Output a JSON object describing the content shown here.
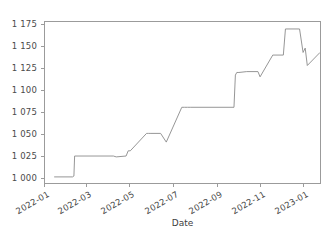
{
  "figure": {
    "title_remnant": "",
    "background_color": "#ffffff",
    "frame_color": "#9b9b9b",
    "line_color": "#8a8a8a"
  },
  "chart_data": {
    "type": "line",
    "title": "",
    "xlabel": "Date",
    "ylabel": "",
    "grid": false,
    "legend": "none",
    "xlim": [
      "2022-01-01",
      "2023-01-26"
    ],
    "ylim": [
      993,
      1178
    ],
    "ytick_labels": [
      "1 175",
      "1 150",
      "1 125",
      "1 100",
      "1 075",
      "1 050",
      "1 025",
      "1 000"
    ],
    "ytick_values": [
      1175,
      1150,
      1125,
      1100,
      1075,
      1050,
      1025,
      1000
    ],
    "xtick_labels": [
      "2022-01",
      "2022-03",
      "2022-05",
      "2022-07",
      "2022-09",
      "2022-11",
      "2023-01"
    ],
    "xtick_values": [
      "2022-01-01",
      "2022-03-01",
      "2022-05-01",
      "2022-07-01",
      "2022-09-01",
      "2022-11-01",
      "2023-01-01"
    ],
    "series": [
      {
        "name": "value",
        "x": [
          "2022-01-14",
          "2022-02-09",
          "2022-02-11",
          "2022-02-12",
          "2022-04-08",
          "2022-04-12",
          "2022-04-26",
          "2022-04-29",
          "2022-05-02",
          "2022-05-25",
          "2022-05-27",
          "2022-05-28",
          "2022-05-30",
          "2022-06-14",
          "2022-06-22",
          "2022-07-14",
          "2022-07-18",
          "2022-07-22",
          "2022-07-26",
          "2022-09-26",
          "2022-09-28",
          "2022-09-30",
          "2022-10-03",
          "2022-10-14",
          "2022-10-30",
          "2022-11-02",
          "2022-11-20",
          "2022-12-05",
          "2022-12-08",
          "2022-12-28",
          "2023-01-02",
          "2023-01-05",
          "2023-01-08",
          "2023-01-26"
        ],
        "y": [
          1000,
          1000,
          1001,
          1024,
          1024,
          1023,
          1024,
          1030,
          1030,
          1050,
          1050,
          1050,
          1050,
          1050,
          1040,
          1080,
          1080,
          1080,
          1080,
          1080,
          1117,
          1120,
          1120,
          1121,
          1121,
          1115,
          1140,
          1140,
          1170,
          1170,
          1143,
          1148,
          1128,
          1143
        ]
      }
    ],
    "annotations": [
      {
        "label": "dip",
        "x": "2022-06-22",
        "y": 1040
      },
      {
        "label": "dip",
        "x": "2022-11-02",
        "y": 1115
      },
      {
        "label": "peak",
        "x": "2022-12-20",
        "y": 1170
      },
      {
        "label": "dip",
        "x": "2023-01-08",
        "y": 1128
      }
    ]
  }
}
